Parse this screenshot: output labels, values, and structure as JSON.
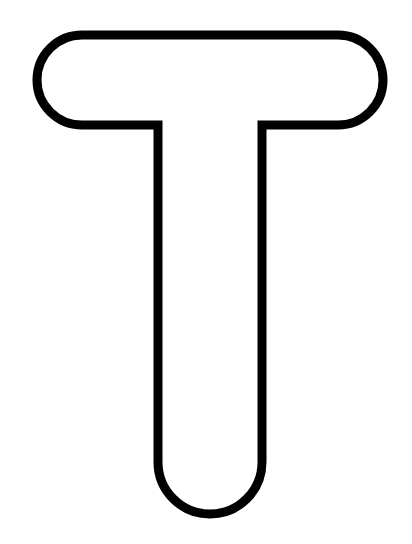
{
  "figure": {
    "letter": "T",
    "stroke_color": "#000000",
    "fill_color": "#ffffff",
    "background_color": "#ffffff"
  }
}
